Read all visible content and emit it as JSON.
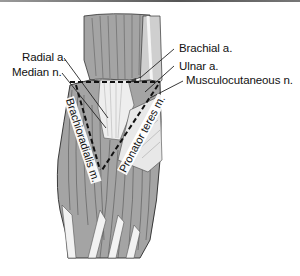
{
  "figure": {
    "labels": {
      "radial_artery": "Radial a.",
      "median_nerve": "Median n.",
      "brachial_artery": "Brachial a.",
      "ulnar_artery": "Ulnar a.",
      "musculocutaneous_nerve": "Musculocutaneous n.",
      "brachioradialis": "Brachioradialis m.",
      "pronator_teres": "Pronator teres m."
    },
    "colors": {
      "muscle_fill": "#a4a4a4",
      "muscle_dark": "#7c7c7c",
      "tendon": "#eeeeee",
      "outline": "#2a2a2a",
      "dashed_boundary": "#111111",
      "text": "#111111"
    }
  }
}
